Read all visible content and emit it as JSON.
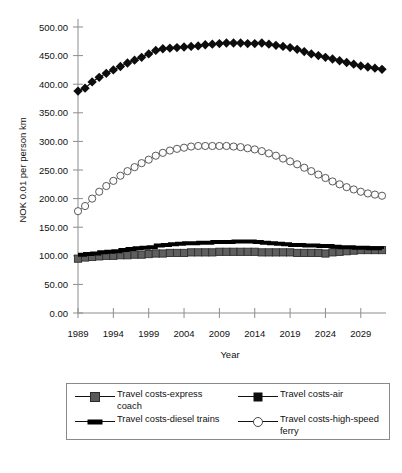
{
  "chart_data": {
    "type": "line",
    "title": "",
    "xlabel": "Year",
    "ylabel": "NOK 0.01 per person km",
    "xlim": [
      1989,
      2032
    ],
    "ylim": [
      0,
      500
    ],
    "grid": false,
    "legend_position": "bottom",
    "y_ticks": [
      "0.00",
      "50.00",
      "100.00",
      "150.00",
      "200.00",
      "250.00",
      "300.00",
      "350.00",
      "400.00",
      "450.00",
      "500.00"
    ],
    "y_tick_values": [
      0,
      50,
      100,
      150,
      200,
      250,
      300,
      350,
      400,
      450,
      500
    ],
    "x_ticks": [
      "1989",
      "1994",
      "1999",
      "2004",
      "2009",
      "2014",
      "2019",
      "2024",
      "2029"
    ],
    "x_tick_values": [
      1989,
      1994,
      1999,
      2004,
      2009,
      2014,
      2019,
      2024,
      2029
    ],
    "x": [
      1989,
      1990,
      1991,
      1992,
      1993,
      1994,
      1995,
      1996,
      1997,
      1998,
      1999,
      2000,
      2001,
      2002,
      2003,
      2004,
      2005,
      2006,
      2007,
      2008,
      2009,
      2010,
      2011,
      2012,
      2013,
      2014,
      2015,
      2016,
      2017,
      2018,
      2019,
      2020,
      2021,
      2022,
      2023,
      2024,
      2025,
      2026,
      2027,
      2028,
      2029,
      2030,
      2031,
      2032
    ],
    "series": [
      {
        "name": "Travel costs-express coach",
        "marker": "square-filled-gray",
        "color": "#595959",
        "values": [
          95,
          97,
          98,
          99,
          100,
          100,
          101,
          101,
          102,
          102,
          103,
          104,
          104,
          105,
          105,
          105,
          106,
          106,
          106,
          106,
          107,
          107,
          107,
          107,
          107,
          107,
          106,
          106,
          106,
          106,
          106,
          105,
          105,
          105,
          105,
          104,
          106,
          107,
          108,
          109,
          110,
          110,
          110,
          110
        ]
      },
      {
        "name": "Travel costs-air",
        "marker": "diamond-filled-black",
        "color": "#0d0d0d",
        "values": [
          388,
          393,
          404,
          412,
          419,
          425,
          431,
          437,
          442,
          447,
          453,
          459,
          462,
          463,
          464,
          465,
          466,
          467,
          469,
          470,
          471,
          472,
          472,
          472,
          471,
          471,
          472,
          470,
          468,
          466,
          464,
          461,
          457,
          453,
          450,
          447,
          444,
          441,
          438,
          435,
          432,
          430,
          428,
          426
        ]
      },
      {
        "name": "Travel costs-diesel trains",
        "marker": "line-thick-black",
        "color": "#000000",
        "values": [
          102,
          103,
          104,
          106,
          107,
          108,
          110,
          112,
          113,
          114,
          115,
          118,
          119,
          120,
          121,
          122,
          122,
          123,
          123,
          124,
          124,
          124,
          125,
          125,
          125,
          124,
          123,
          122,
          121,
          120,
          119,
          119,
          118,
          118,
          117,
          117,
          116,
          115,
          115,
          114,
          114,
          113,
          113,
          112
        ]
      },
      {
        "name": "Travel costs-high-speed ferry",
        "marker": "circle-open",
        "color": "#4a4a4a",
        "values": [
          178,
          187,
          200,
          212,
          222,
          231,
          240,
          248,
          255,
          262,
          268,
          275,
          280,
          284,
          287,
          289,
          291,
          292,
          292,
          292,
          292,
          292,
          291,
          290,
          288,
          286,
          283,
          279,
          275,
          270,
          265,
          260,
          254,
          248,
          242,
          236,
          230,
          225,
          220,
          216,
          212,
          209,
          207,
          205
        ]
      }
    ]
  },
  "legend": {
    "entries": [
      {
        "label": "Travel costs-express coach",
        "key": "square-filled-gray"
      },
      {
        "label": "Travel costs-air",
        "key": "diamond-filled-black"
      },
      {
        "label": "Travel costs-diesel trains",
        "key": "line-thick-black"
      },
      {
        "label": "Travel costs-high-speed ferry",
        "key": "circle-open"
      }
    ]
  },
  "axes": {
    "x_title": "Year",
    "y_title": "NOK 0.01 per person km"
  }
}
